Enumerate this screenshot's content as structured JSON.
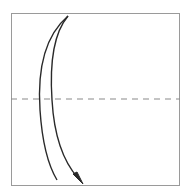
{
  "diagram": {
    "type": "origami-fold-step",
    "paper": {
      "shape": "square",
      "x": 11,
      "y": 13,
      "width": 169,
      "height": 173,
      "stroke": "#9a9a9a",
      "fill": "#ffffff"
    },
    "fold_line": {
      "style": "valley-dashed",
      "y": 99,
      "stroke": "#8a8a8a"
    },
    "arrow": {
      "direction": "top-to-bottom",
      "meaning": "fold top edge down",
      "stroke": "#2a2a2a"
    }
  }
}
